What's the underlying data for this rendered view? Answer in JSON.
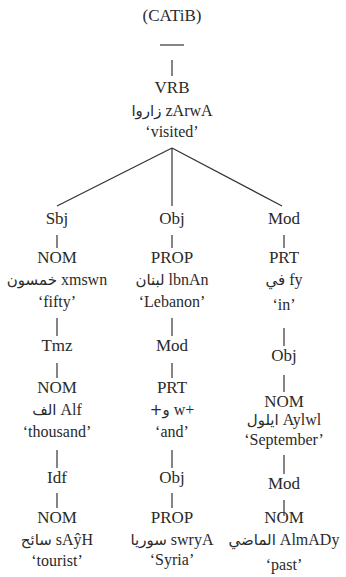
{
  "title": "(CATiB)",
  "root": {
    "tag": "VRB",
    "arabic": "زاروا",
    "translit": "zArwA",
    "gloss": "‘visited’"
  },
  "columns": [
    {
      "relation": "Sbj",
      "nodes": [
        {
          "tag": "NOM",
          "arabic": "خمسون",
          "translit": "xmswn",
          "gloss": "‘fifty’"
        },
        {
          "relation": "Tmz"
        },
        {
          "tag": "NOM",
          "arabic": "الف",
          "translit": "Alf",
          "gloss": "‘thousand’"
        },
        {
          "relation": "Idf"
        },
        {
          "tag": "NOM",
          "arabic": "سائح",
          "translit": "sAŷH",
          "gloss": "‘tourist’"
        }
      ]
    },
    {
      "relation": "Obj",
      "nodes": [
        {
          "tag": "PROP",
          "arabic": "لبنان",
          "translit": "lbnAn",
          "gloss": "‘Lebanon’"
        },
        {
          "relation": "Mod"
        },
        {
          "tag": "PRT",
          "arabic": "+و",
          "translit": "w+",
          "gloss": "‘and’"
        },
        {
          "relation": "Obj"
        },
        {
          "tag": "PROP",
          "arabic": "سوريا",
          "translit": "swryA",
          "gloss": "‘Syria’"
        }
      ]
    },
    {
      "relation": "Mod",
      "nodes": [
        {
          "tag": "PRT",
          "arabic": "في",
          "translit": "fy",
          "gloss": "‘in’"
        },
        {
          "relation": "Obj"
        },
        {
          "tag": "NOM",
          "arabic": "ايلول",
          "translit": "Aylwl",
          "gloss": "‘September’"
        },
        {
          "relation": "Mod"
        },
        {
          "tag": "NOM",
          "arabic": "الماضي",
          "translit": "AlmADy",
          "gloss": "‘past’"
        }
      ]
    }
  ]
}
